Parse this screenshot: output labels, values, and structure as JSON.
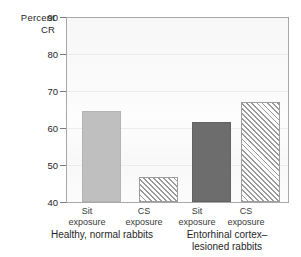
{
  "chart_data": {
    "type": "bar",
    "title": "",
    "ylabel": "Percent CR",
    "ylabel_lines": [
      "Percent",
      "CR"
    ],
    "xlabel": "",
    "ylim": [
      40,
      90
    ],
    "yticks": [
      40,
      50,
      60,
      70,
      80,
      90
    ],
    "ytick_labels": [
      "40",
      "50",
      "60",
      "70",
      "80",
      "90"
    ],
    "grid": true,
    "legend": "none",
    "categories": [
      "Sit exposure",
      "CS exposure",
      "Sit exposure",
      "CS exposure"
    ],
    "values": [
      64.5,
      46.8,
      61.5,
      66.8
    ],
    "bars": [
      {
        "label_line1": "Sit",
        "label_line2": "exposure",
        "value": 64.5,
        "style": "solid-light",
        "group": "Healthy, normal rabbits"
      },
      {
        "label_line1": "CS",
        "label_line2": "exposure",
        "value": 46.8,
        "style": "hatch",
        "group": "Healthy, normal rabbits"
      },
      {
        "label_line1": "Sit",
        "label_line2": "exposure",
        "value": 61.5,
        "style": "solid-dark",
        "group": "Entorhinal cortex–lesioned rabbits"
      },
      {
        "label_line1": "CS",
        "label_line2": "exposure",
        "value": 66.8,
        "style": "hatch",
        "group": "Entorhinal cortex–lesioned rabbits"
      }
    ],
    "groups": [
      {
        "line1": "Healthy, normal rabbits",
        "line2": ""
      },
      {
        "line1": "Entorhinal cortex–",
        "line2": "lesioned rabbits"
      }
    ],
    "colors": {
      "solid_light": "#bfbfbf",
      "solid_dark": "#6d6d6d",
      "hatch_line": "#9a9a9a",
      "axis": "#a8a8a8",
      "grid": "#ececec",
      "text": "#262626",
      "background": "#ffffff"
    }
  }
}
